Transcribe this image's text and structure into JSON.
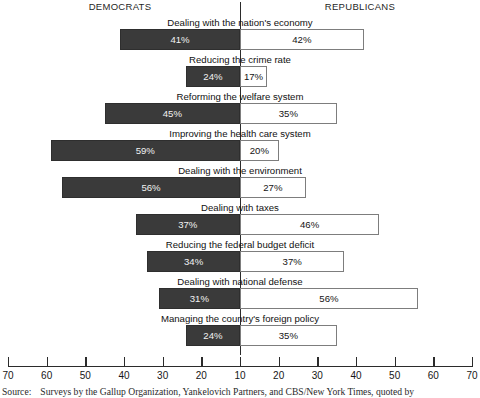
{
  "headers": {
    "left": "DEMOCRATS",
    "right": "REPUBLICANS"
  },
  "source": {
    "label": "Source:",
    "text": "Surveys by the Gallup Organization, Yankelovich Partners, and CBS/New York Times, quoted by"
  },
  "chart_data": {
    "type": "bar",
    "subtype": "diverging-horizontal",
    "title": "",
    "xlabel": "",
    "ylabel": "",
    "legend_position": "top",
    "grid": false,
    "center_value": 10,
    "axis_px": {
      "left_tick_x": 8,
      "right_tick_x": 472,
      "center_x": 240,
      "px_per_unit": 3.8667
    },
    "xticks": [
      70,
      60,
      50,
      40,
      30,
      20,
      10,
      20,
      30,
      40,
      50,
      60,
      70
    ],
    "xtick_labels": [
      "70",
      "60",
      "50",
      "40",
      "30",
      "20",
      "10",
      "20",
      "30",
      "40",
      "50",
      "60",
      "70"
    ],
    "series": [
      {
        "name": "DEMOCRATS",
        "side": "left",
        "color": "#3a3a3a"
      },
      {
        "name": "REPUBLICANS",
        "side": "right",
        "color": "#ffffff"
      }
    ],
    "categories": [
      "Dealing with the nation's economy",
      "Reducing the crime rate",
      "Reforming the welfare system",
      "Improving the health care system",
      "Dealing with the environment",
      "Dealing with taxes",
      "Reducing the federal budget deficit",
      "Dealing with national defense",
      "Managing the country's foreign policy"
    ],
    "rows": [
      {
        "label": "Dealing with the nation's economy",
        "left_value": 41,
        "right_value": 42,
        "left_label": "41%",
        "right_label": "42%"
      },
      {
        "label": "Reducing the crime rate",
        "left_value": 24,
        "right_value": 17,
        "left_label": "24%",
        "right_label": "17%"
      },
      {
        "label": "Reforming the welfare system",
        "left_value": 45,
        "right_value": 35,
        "left_label": "45%",
        "right_label": "35%"
      },
      {
        "label": "Improving the health care system",
        "left_value": 59,
        "right_value": 20,
        "left_label": "59%",
        "right_label": "20%"
      },
      {
        "label": "Dealing with the environment",
        "left_value": 56,
        "right_value": 27,
        "left_label": "56%",
        "right_label": "27%"
      },
      {
        "label": "Dealing with taxes",
        "left_value": 37,
        "right_value": 46,
        "left_label": "37%",
        "right_label": "46%"
      },
      {
        "label": "Reducing the federal budget deficit",
        "left_value": 34,
        "right_value": 37,
        "left_label": "34%",
        "right_label": "37%"
      },
      {
        "label": "Dealing with national defense",
        "left_value": 31,
        "right_value": 56,
        "left_label": "31%",
        "right_label": "56%"
      },
      {
        "label": "Managing the country's foreign policy",
        "left_value": 24,
        "right_value": 35,
        "left_label": "24%",
        "right_label": "35%"
      }
    ]
  }
}
